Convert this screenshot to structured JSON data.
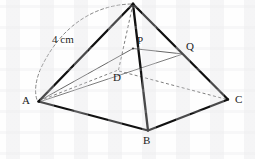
{
  "figure": {
    "background_color": "#fefefe",
    "stroke_color": "#111111",
    "thin_stroke_color": "#4a4a4a",
    "dashed_stroke_color": "#6e6e6e",
    "measure_label": "4 cm",
    "vertex_labels": {
      "a": "A",
      "b": "B",
      "c": "C",
      "d": "D",
      "p": "P",
      "q": "Q"
    },
    "points": {
      "apex": {
        "x": 133,
        "y": 3
      },
      "a": {
        "x": 38,
        "y": 102
      },
      "b": {
        "x": 148,
        "y": 131
      },
      "c": {
        "x": 228,
        "y": 100
      },
      "d": {
        "x": 118,
        "y": 70
      },
      "p": {
        "x": 133,
        "y": 48
      },
      "q": {
        "x": 182,
        "y": 53
      }
    },
    "label_positions": {
      "a": {
        "x": 22,
        "y": 99
      },
      "b": {
        "x": 143,
        "y": 136
      },
      "c": {
        "x": 235,
        "y": 96
      },
      "d": {
        "x": 113,
        "y": 73
      },
      "p": {
        "x": 136,
        "y": 36
      },
      "q": {
        "x": 186,
        "y": 42
      },
      "measure": {
        "x": 52,
        "y": 34
      }
    },
    "edges": [
      {
        "name": "apex-to-a",
        "style": "solid-thick"
      },
      {
        "name": "apex-to-b",
        "style": "solid-thick"
      },
      {
        "name": "apex-to-c",
        "style": "solid-thick"
      },
      {
        "name": "a-to-b",
        "style": "solid-thick"
      },
      {
        "name": "b-to-c",
        "style": "solid-thick"
      },
      {
        "name": "apex-to-d",
        "style": "dashed"
      },
      {
        "name": "a-to-d",
        "style": "dashed"
      },
      {
        "name": "d-to-c",
        "style": "dashed"
      },
      {
        "name": "a-to-p",
        "style": "solid-thin"
      },
      {
        "name": "p-to-q",
        "style": "solid-thin"
      },
      {
        "name": "a-to-q",
        "style": "solid-thin"
      },
      {
        "name": "measure-arc",
        "style": "dashed-arc"
      }
    ]
  }
}
